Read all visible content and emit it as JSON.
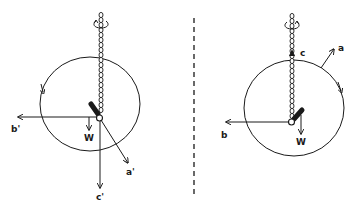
{
  "diagram": {
    "type": "physics-pendulum-comparison",
    "colors": {
      "ink": "#1a1a1a",
      "background": "#ffffff"
    },
    "divider": {
      "style": "dashed",
      "x": 194
    },
    "left_panel": {
      "labels": {
        "b": "b'",
        "w": "W",
        "a": "a'",
        "c": "c'"
      },
      "rotation_direction": "counterclockwise"
    },
    "right_panel": {
      "labels": {
        "b": "b",
        "w": "W",
        "a": "a",
        "c": "c"
      },
      "rotation_direction": "clockwise"
    }
  }
}
